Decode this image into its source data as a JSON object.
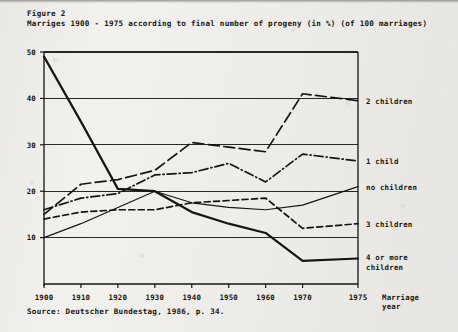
{
  "figure": {
    "label": "Figure 2",
    "subtitle": "Marriges 1900 - 1975 according to final number of progeny (in %) (of 100 marriages)",
    "source": "Source: Deutscher Bundestag, 1986, p. 34."
  },
  "chart_data": {
    "type": "line",
    "title": "Marriges 1900 - 1975 according to final number of progeny (in %) (of 100 marriages)",
    "xlabel": "Marriage year",
    "ylabel": "",
    "x": [
      1900,
      1910,
      1920,
      1930,
      1940,
      1950,
      1960,
      1970,
      1975
    ],
    "xtick_labels": [
      "1900",
      "1910",
      "1920",
      "1930",
      "1940",
      "1950",
      "1960",
      "1970",
      "1975"
    ],
    "ytick_labels": [
      "10",
      "20",
      "30",
      "40",
      "50"
    ],
    "yticks": [
      10,
      20,
      30,
      40,
      50
    ],
    "ylim": [
      0,
      50
    ],
    "grid": true,
    "legend_position": "right",
    "series": [
      {
        "name": "2 children",
        "label": "2 children",
        "style": "long-dash",
        "values": [
          15.0,
          21.5,
          22.5,
          24.5,
          30.5,
          29.5,
          28.5,
          41.0,
          39.5
        ]
      },
      {
        "name": "1 child",
        "label": "1 child",
        "style": "dash-dot",
        "values": [
          16.0,
          18.5,
          19.5,
          23.5,
          24.0,
          26.0,
          22.0,
          28.0,
          26.5
        ]
      },
      {
        "name": "no children",
        "label": "no children",
        "style": "solid-thin",
        "values": [
          10.0,
          13.0,
          16.5,
          20.0,
          17.5,
          16.5,
          16.0,
          17.0,
          21.0
        ]
      },
      {
        "name": "3 children",
        "label": "3 children",
        "style": "dash",
        "values": [
          14.0,
          15.5,
          16.0,
          16.0,
          17.5,
          18.0,
          18.5,
          12.0,
          13.0
        ]
      },
      {
        "name": "4 or more children",
        "label": "4 or more children",
        "label_line1": "4 or more",
        "label_line2": "children",
        "style": "solid-thick",
        "values": [
          49.0,
          35.0,
          20.5,
          20.0,
          15.5,
          13.0,
          11.0,
          5.0,
          5.5
        ]
      }
    ]
  },
  "colors": {
    "ink": "#17150f",
    "paper": "#f2f1ee",
    "grid": "#2a2824"
  }
}
